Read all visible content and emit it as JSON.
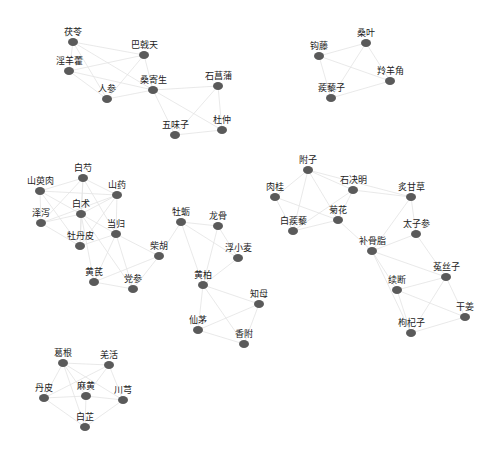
{
  "diagram": {
    "type": "network",
    "node_color": "#5a5a5a",
    "edge_color": "#e3e3e3",
    "label_color": "#222222",
    "nodes": [
      {
        "id": "fuling",
        "label": "茯苓",
        "x": 73,
        "y": 42
      },
      {
        "id": "bajitian",
        "label": "巴戟天",
        "x": 144,
        "y": 55
      },
      {
        "id": "yinyanghuo",
        "label": "淫羊藿",
        "x": 69,
        "y": 71
      },
      {
        "id": "renshen",
        "label": "人参",
        "x": 107,
        "y": 99
      },
      {
        "id": "sangjisheng",
        "label": "桑寄生",
        "x": 153,
        "y": 90
      },
      {
        "id": "shichangpu",
        "label": "石菖蒲",
        "x": 218,
        "y": 86
      },
      {
        "id": "wuweizi",
        "label": "五味子",
        "x": 175,
        "y": 135
      },
      {
        "id": "duzhong",
        "label": "杜仲",
        "x": 222,
        "y": 130
      },
      {
        "id": "sangye",
        "label": "桑叶",
        "x": 366,
        "y": 43
      },
      {
        "id": "gouteng",
        "label": "钩藤",
        "x": 319,
        "y": 56
      },
      {
        "id": "lingyangjiao",
        "label": "羚羊角",
        "x": 390,
        "y": 81
      },
      {
        "id": "jilizi",
        "label": "蒺藜子",
        "x": 331,
        "y": 98
      },
      {
        "id": "baishao",
        "label": "白芍",
        "x": 83,
        "y": 178
      },
      {
        "id": "shanyurou",
        "label": "山萸肉",
        "x": 40,
        "y": 191
      },
      {
        "id": "shanyao",
        "label": "山药",
        "x": 117,
        "y": 195
      },
      {
        "id": "baizhu",
        "label": "白术",
        "x": 81,
        "y": 214
      },
      {
        "id": "zexie",
        "label": "泽泻",
        "x": 41,
        "y": 223
      },
      {
        "id": "danggui",
        "label": "当归",
        "x": 116,
        "y": 234
      },
      {
        "id": "mudanpi",
        "label": "牡丹皮",
        "x": 80,
        "y": 246
      },
      {
        "id": "chaihu",
        "label": "柴胡",
        "x": 159,
        "y": 256
      },
      {
        "id": "huangqi",
        "label": "黄芪",
        "x": 94,
        "y": 282
      },
      {
        "id": "dangshen",
        "label": "党参",
        "x": 133,
        "y": 289
      },
      {
        "id": "muli",
        "label": "牡蛎",
        "x": 181,
        "y": 222
      },
      {
        "id": "longgu",
        "label": "龙骨",
        "x": 218,
        "y": 226
      },
      {
        "id": "fuxiaomai",
        "label": "浮小麦",
        "x": 238,
        "y": 258
      },
      {
        "id": "huangbai",
        "label": "黄柏",
        "x": 203,
        "y": 285
      },
      {
        "id": "zhimu",
        "label": "知母",
        "x": 259,
        "y": 304
      },
      {
        "id": "xianmao",
        "label": "仙茅",
        "x": 198,
        "y": 330
      },
      {
        "id": "xiangfu",
        "label": "香附",
        "x": 244,
        "y": 344
      },
      {
        "id": "fuzi",
        "label": "附子",
        "x": 308,
        "y": 170
      },
      {
        "id": "rougui",
        "label": "肉桂",
        "x": 275,
        "y": 197
      },
      {
        "id": "shijueming",
        "label": "石决明",
        "x": 353,
        "y": 190
      },
      {
        "id": "zhigancao",
        "label": "炙甘草",
        "x": 411,
        "y": 197
      },
      {
        "id": "baijili",
        "label": "白蒺藜",
        "x": 293,
        "y": 231
      },
      {
        "id": "juhua",
        "label": "菊花",
        "x": 338,
        "y": 220
      },
      {
        "id": "taizishen",
        "label": "太子参",
        "x": 416,
        "y": 234
      },
      {
        "id": "buguzhi",
        "label": "补骨脂",
        "x": 372,
        "y": 251
      },
      {
        "id": "xuduan",
        "label": "续断",
        "x": 397,
        "y": 290
      },
      {
        "id": "tusizi",
        "label": "菟丝子",
        "x": 446,
        "y": 277
      },
      {
        "id": "ganjiang",
        "label": "干姜",
        "x": 465,
        "y": 317
      },
      {
        "id": "gouqizi",
        "label": "枸杞子",
        "x": 411,
        "y": 333
      },
      {
        "id": "gegen",
        "label": "葛根",
        "x": 63,
        "y": 363
      },
      {
        "id": "qianghuo",
        "label": "羌活",
        "x": 109,
        "y": 365
      },
      {
        "id": "danpi",
        "label": "丹皮",
        "x": 44,
        "y": 398
      },
      {
        "id": "mahuang",
        "label": "麻黄",
        "x": 86,
        "y": 396
      },
      {
        "id": "chuanxiong",
        "label": "川芎",
        "x": 123,
        "y": 400
      },
      {
        "id": "baizhi",
        "label": "白芷",
        "x": 85,
        "y": 427
      }
    ],
    "edges": [
      [
        "fuling",
        "bajitian"
      ],
      [
        "fuling",
        "yinyanghuo"
      ],
      [
        "fuling",
        "renshen"
      ],
      [
        "fuling",
        "sangjisheng"
      ],
      [
        "bajitian",
        "yinyanghuo"
      ],
      [
        "bajitian",
        "renshen"
      ],
      [
        "bajitian",
        "sangjisheng"
      ],
      [
        "yinyanghuo",
        "renshen"
      ],
      [
        "yinyanghuo",
        "sangjisheng"
      ],
      [
        "renshen",
        "sangjisheng"
      ],
      [
        "sangjisheng",
        "shichangpu"
      ],
      [
        "sangjisheng",
        "wuweizi"
      ],
      [
        "sangjisheng",
        "duzhong"
      ],
      [
        "shichangpu",
        "wuweizi"
      ],
      [
        "shichangpu",
        "duzhong"
      ],
      [
        "wuweizi",
        "duzhong"
      ],
      [
        "sangye",
        "gouteng"
      ],
      [
        "sangye",
        "lingyangjiao"
      ],
      [
        "sangye",
        "jilizi"
      ],
      [
        "gouteng",
        "lingyangjiao"
      ],
      [
        "gouteng",
        "jilizi"
      ],
      [
        "lingyangjiao",
        "jilizi"
      ],
      [
        "baishao",
        "shanyurou"
      ],
      [
        "baishao",
        "shanyao"
      ],
      [
        "baishao",
        "baizhu"
      ],
      [
        "baishao",
        "zexie"
      ],
      [
        "baishao",
        "mudanpi"
      ],
      [
        "baishao",
        "danggui"
      ],
      [
        "shanyurou",
        "shanyao"
      ],
      [
        "shanyurou",
        "baizhu"
      ],
      [
        "shanyurou",
        "zexie"
      ],
      [
        "shanyurou",
        "mudanpi"
      ],
      [
        "shanyao",
        "baizhu"
      ],
      [
        "shanyao",
        "zexie"
      ],
      [
        "shanyao",
        "mudanpi"
      ],
      [
        "shanyao",
        "danggui"
      ],
      [
        "baizhu",
        "zexie"
      ],
      [
        "baizhu",
        "danggui"
      ],
      [
        "baizhu",
        "mudanpi"
      ],
      [
        "baizhu",
        "huangqi"
      ],
      [
        "baizhu",
        "dangshen"
      ],
      [
        "zexie",
        "mudanpi"
      ],
      [
        "danggui",
        "chaihu"
      ],
      [
        "danggui",
        "huangqi"
      ],
      [
        "danggui",
        "dangshen"
      ],
      [
        "danggui",
        "mudanpi"
      ],
      [
        "huangqi",
        "dangshen"
      ],
      [
        "chaihu",
        "dangshen"
      ],
      [
        "chaihu",
        "huangqi"
      ],
      [
        "muli",
        "longgu"
      ],
      [
        "muli",
        "fuxiaomai"
      ],
      [
        "muli",
        "huangbai"
      ],
      [
        "muli",
        "chaihu"
      ],
      [
        "longgu",
        "fuxiaomai"
      ],
      [
        "longgu",
        "huangbai"
      ],
      [
        "fuxiaomai",
        "huangbai"
      ],
      [
        "huangbai",
        "zhimu"
      ],
      [
        "huangbai",
        "xianmao"
      ],
      [
        "huangbai",
        "xiangfu"
      ],
      [
        "zhimu",
        "xianmao"
      ],
      [
        "zhimu",
        "xiangfu"
      ],
      [
        "xianmao",
        "xiangfu"
      ],
      [
        "fuzi",
        "rougui"
      ],
      [
        "fuzi",
        "shijueming"
      ],
      [
        "fuzi",
        "baijili"
      ],
      [
        "fuzi",
        "juhua"
      ],
      [
        "fuzi",
        "zhigancao"
      ],
      [
        "rougui",
        "baijili"
      ],
      [
        "rougui",
        "juhua"
      ],
      [
        "shijueming",
        "juhua"
      ],
      [
        "shijueming",
        "baijili"
      ],
      [
        "shijueming",
        "zhigancao"
      ],
      [
        "baijili",
        "juhua"
      ],
      [
        "juhua",
        "buguzhi"
      ],
      [
        "zhigancao",
        "taizishen"
      ],
      [
        "zhigancao",
        "buguzhi"
      ],
      [
        "taizishen",
        "buguzhi"
      ],
      [
        "taizishen",
        "tusizi"
      ],
      [
        "buguzhi",
        "xuduan"
      ],
      [
        "buguzhi",
        "tusizi"
      ],
      [
        "buguzhi",
        "gouqizi"
      ],
      [
        "xuduan",
        "tusizi"
      ],
      [
        "xuduan",
        "gouqizi"
      ],
      [
        "xuduan",
        "ganjiang"
      ],
      [
        "tusizi",
        "ganjiang"
      ],
      [
        "tusizi",
        "gouqizi"
      ],
      [
        "ganjiang",
        "gouqizi"
      ],
      [
        "gegen",
        "qianghuo"
      ],
      [
        "gegen",
        "danpi"
      ],
      [
        "gegen",
        "mahuang"
      ],
      [
        "gegen",
        "chuanxiong"
      ],
      [
        "gegen",
        "baizhi"
      ],
      [
        "qianghuo",
        "mahuang"
      ],
      [
        "qianghuo",
        "chuanxiong"
      ],
      [
        "qianghuo",
        "danpi"
      ],
      [
        "danpi",
        "mahuang"
      ],
      [
        "danpi",
        "baizhi"
      ],
      [
        "mahuang",
        "chuanxiong"
      ],
      [
        "mahuang",
        "baizhi"
      ],
      [
        "chuanxiong",
        "baizhi"
      ]
    ]
  }
}
